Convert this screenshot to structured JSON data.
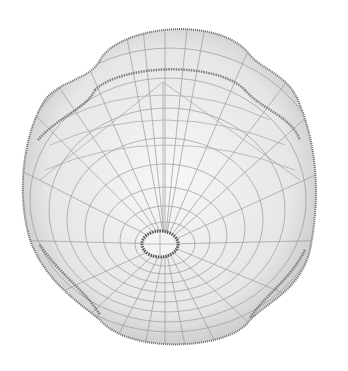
{
  "image": {
    "subject": "3D wireframe mesh surface",
    "description": "Lobed closed surface with a small circular hole near the lower center, rendered as a gray wireframe on white background",
    "colors": {
      "background": "#ffffff",
      "mesh_dark": "#555555",
      "mesh_light": "#a8a8a8",
      "fill": "#ececec"
    }
  }
}
